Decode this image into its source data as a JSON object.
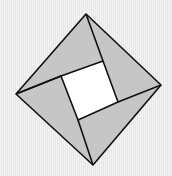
{
  "figure": {
    "colors": {
      "background": "#ededed",
      "triangle_fill": "#c6c6c6",
      "inner_square_fill": "#ffffff",
      "stroke": "#111111"
    },
    "outer_vertices": {
      "top": [
        86,
        14
      ],
      "right": [
        161,
        85
      ],
      "bottom": [
        93,
        165
      ],
      "left": [
        16,
        94
      ]
    },
    "inner_vertices": {
      "top_left": [
        61,
        76
      ],
      "top_right": [
        103,
        61
      ],
      "bottom_right": [
        118,
        102
      ],
      "bottom_left": [
        78,
        120
      ]
    },
    "triangle_count": 4
  }
}
